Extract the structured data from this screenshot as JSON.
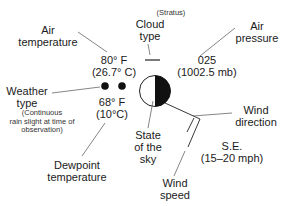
{
  "labels": {
    "air_temperature": [
      "Air",
      "temperature"
    ],
    "cloud_type": [
      "Cloud",
      "type"
    ],
    "cloud_type_note": "(Stratus)",
    "air_pressure": [
      "Air",
      "pressure"
    ],
    "weather_type": [
      "Weather",
      "type"
    ],
    "weather_type_note": [
      "(Continuous",
      "rain slight at time of",
      "observation)"
    ],
    "dewpoint_temperature": [
      "Dewpoint",
      "temperature"
    ],
    "state_of_sky": [
      "State",
      "of the",
      "sky"
    ],
    "wind_direction": [
      "Wind",
      "direction"
    ],
    "wind_speed": [
      "Wind",
      "speed"
    ]
  },
  "values": {
    "air_temp_f": "80° F",
    "air_temp_c": "(26.7° C)",
    "pressure_code": "025",
    "pressure_mb": "(1002.5 mb)",
    "dewpoint_f": "68° F",
    "dewpoint_c": "(10°C)",
    "wind_dir": "S.E.",
    "wind_speed": "(15–20 mph)"
  },
  "symbols": {
    "station_circle": "half-filled (right half black)",
    "weather_symbol": "two dots (continuous slight rain)",
    "cloud_symbol": "horizontal bar (stratus)",
    "wind_barb": "staff to S.E. with one full barb"
  },
  "colors": {
    "ink": "#1a1a1a",
    "leader_line": "#555555",
    "background": "#ffffff"
  }
}
